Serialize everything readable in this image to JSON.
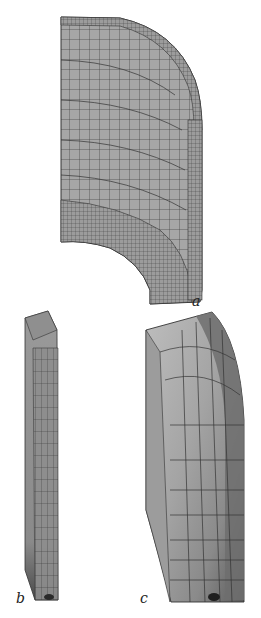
{
  "figure": {
    "panels": [
      {
        "id": "a",
        "label": "a",
        "description": "quarter-section finite element mesh of curved shell"
      },
      {
        "id": "b",
        "label": "b",
        "description": "thin slab mesh segment"
      },
      {
        "id": "c",
        "label": "c",
        "description": "shaded mesh segment with gray contour zones"
      }
    ],
    "colors": {
      "mesh_fill": "#a8a8a8",
      "mesh_line": "#3a3a3a",
      "light_zone": "#b9b9b9",
      "mid_zone": "#9a9a9a",
      "dark_zone": "#6e6e6e",
      "darkest": "#2a2a2a"
    }
  }
}
